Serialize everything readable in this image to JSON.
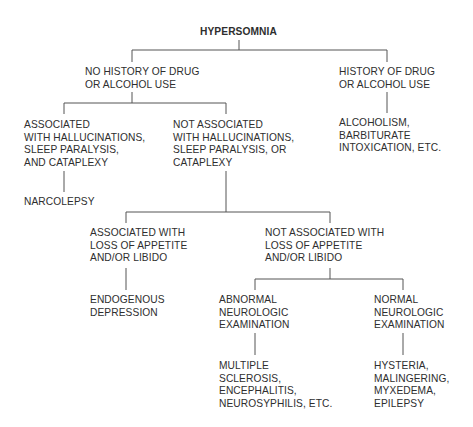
{
  "diagram": {
    "type": "decision-tree",
    "root": {
      "id": "hypersomnia",
      "lines": [
        "HYPERSOMNIA"
      ]
    },
    "nodes": {
      "no_history": {
        "lines": [
          "NO HISTORY OF DRUG",
          "OR ALCOHOL USE"
        ]
      },
      "history": {
        "lines": [
          "HISTORY OF DRUG",
          "OR ALCOHOL USE"
        ]
      },
      "alcoholism": {
        "lines": [
          "ALCOHOLISM,",
          "BARBITURATE",
          "INTOXICATION, ETC."
        ]
      },
      "assoc_hall": {
        "lines": [
          "ASSOCIATED",
          "WITH HALLUCINATIONS,",
          "SLEEP PARALYSIS,",
          "AND CATAPLEXY"
        ]
      },
      "not_assoc_hall": {
        "lines": [
          "NOT ASSOCIATED",
          "WITH HALLUCINATIONS,",
          "SLEEP PARALYSIS, OR",
          "CATAPLEXY"
        ]
      },
      "narcolepsy": {
        "lines": [
          "NARCOLEPSY"
        ]
      },
      "assoc_appetite": {
        "lines": [
          "ASSOCIATED WITH",
          "LOSS OF APPETITE",
          "AND/OR LIBIDO"
        ]
      },
      "not_assoc_appetite": {
        "lines": [
          "NOT ASSOCIATED WITH",
          "LOSS OF APPETITE",
          "AND/OR LIBIDO"
        ]
      },
      "endogenous": {
        "lines": [
          "ENDOGENOUS",
          "DEPRESSION"
        ]
      },
      "abnormal_neuro": {
        "lines": [
          "ABNORMAL",
          "NEUROLOGIC",
          "EXAMINATION"
        ]
      },
      "normal_neuro": {
        "lines": [
          "NORMAL",
          "NEUROLOGIC",
          "EXAMINATION"
        ]
      },
      "multiple": {
        "lines": [
          "MULTIPLE",
          "SCLEROSIS,",
          "ENCEPHALITIS,",
          "NEUROSYPHILIS, ETC."
        ]
      },
      "hysteria": {
        "lines": [
          "HYSTERIA,",
          "MALINGERING,",
          "MYXEDEMA,",
          "EPILEPSY"
        ]
      }
    },
    "edges": [
      [
        "hypersomnia",
        "no_history"
      ],
      [
        "hypersomnia",
        "history"
      ],
      [
        "history",
        "alcoholism"
      ],
      [
        "no_history",
        "assoc_hall"
      ],
      [
        "no_history",
        "not_assoc_hall"
      ],
      [
        "assoc_hall",
        "narcolepsy"
      ],
      [
        "not_assoc_hall",
        "assoc_appetite"
      ],
      [
        "not_assoc_hall",
        "not_assoc_appetite"
      ],
      [
        "assoc_appetite",
        "endogenous"
      ],
      [
        "not_assoc_appetite",
        "abnormal_neuro"
      ],
      [
        "not_assoc_appetite",
        "normal_neuro"
      ],
      [
        "abnormal_neuro",
        "multiple"
      ],
      [
        "normal_neuro",
        "hysteria"
      ]
    ],
    "colors": {
      "text": "#2e2e2e",
      "line": "#555555",
      "background": "#ffffff"
    }
  }
}
